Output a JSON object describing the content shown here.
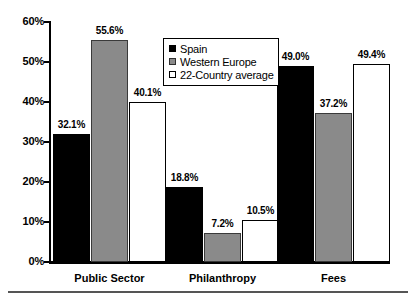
{
  "chart_data": {
    "type": "bar",
    "title": "",
    "xlabel": "",
    "ylabel": "",
    "ylim": [
      0,
      60
    ],
    "grid": false,
    "legend_position": "top-center",
    "categories": [
      "Public Sector",
      "Philanthropy",
      "Fees"
    ],
    "tick_labels": [
      "60%",
      "50%",
      "40%",
      "30%",
      "20%",
      "10%",
      "0%"
    ],
    "tick_values": [
      60,
      50,
      40,
      30,
      20,
      10,
      0
    ],
    "series": [
      {
        "name": "Spain",
        "color": "#000000",
        "values": [
          32.1,
          18.8,
          49.0
        ],
        "labels": [
          "32.1%",
          "18.8%",
          "49.0%"
        ]
      },
      {
        "name": "Western Europe",
        "color": "#8a8a8a",
        "values": [
          55.6,
          7.2,
          37.2
        ],
        "labels": [
          "55.6%",
          "7.2%",
          "37.2%"
        ]
      },
      {
        "name": "22-Country average",
        "color": "#ffffff",
        "values": [
          40.1,
          10.5,
          49.4
        ],
        "labels": [
          "40.1%",
          "10.5%",
          "49.4%"
        ]
      }
    ]
  },
  "legend": {
    "items": [
      {
        "label": "Spain"
      },
      {
        "label": "Western Europe"
      },
      {
        "label": "22-Country average"
      }
    ]
  },
  "axis": {
    "y_ticks": [
      {
        "label": "60%"
      },
      {
        "label": "50%"
      },
      {
        "label": "40%"
      },
      {
        "label": "30%"
      },
      {
        "label": "20%"
      },
      {
        "label": "10%"
      },
      {
        "label": "0%"
      }
    ]
  }
}
